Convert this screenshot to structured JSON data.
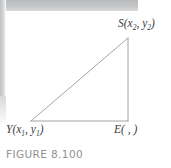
{
  "figure": {
    "caption": "FIGURE 8.100",
    "background_color": "#ffffff",
    "line_color": "#9a9a9a",
    "label_color": "#3b3b3b",
    "caption_color": "#8f9194",
    "scan_band_color": "#bfc1c3"
  },
  "labels": {
    "vertex_s": {
      "name": "S",
      "open_paren": "(",
      "x_var": "x",
      "x_sub": "2",
      "comma": ", ",
      "y_var": "y",
      "y_sub": "2",
      "close_paren": ")",
      "full_text": "S(x2, y2)"
    },
    "vertex_y": {
      "name": "Y",
      "open_paren": "(",
      "x_var": "x",
      "x_sub": "1",
      "comma": ", ",
      "y_var": "y",
      "y_sub": "1",
      "close_paren": ")",
      "full_text": "Y(x1, y1)"
    },
    "vertex_e": {
      "name": "E",
      "coords_blank": "(  ,  )",
      "full_text": "E(  ,  )"
    }
  },
  "geometry": {
    "shape": "right-triangle",
    "vertices": {
      "Y": {
        "x": 31,
        "y": 121
      },
      "E": {
        "x": 128,
        "y": 121
      },
      "S": {
        "x": 128,
        "y": 38
      }
    },
    "edges": [
      {
        "name": "hypotenuse-YS",
        "from": "Y",
        "to": "S"
      },
      {
        "name": "base-YE",
        "from": "Y",
        "to": "E"
      },
      {
        "name": "vertical-ES",
        "from": "E",
        "to": "S"
      }
    ]
  }
}
